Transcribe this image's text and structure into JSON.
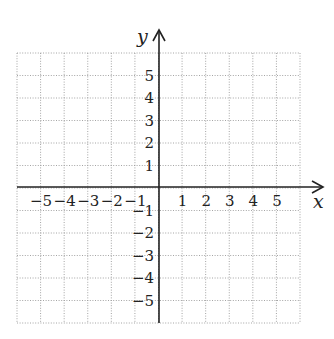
{
  "figure": {
    "type": "coordinate-plane",
    "x_axis_label": "x",
    "y_axis_label": "y",
    "x_range": [
      -6,
      6
    ],
    "y_range": [
      -6,
      6
    ],
    "x_tick_labels": [
      "−5",
      "−4",
      "−3",
      "−2",
      "−1",
      "1",
      "2",
      "3",
      "4",
      "5"
    ],
    "y_tick_labels": [
      "5",
      "4",
      "3",
      "2",
      "1",
      "−1",
      "−2",
      "−3",
      "−4",
      "−5"
    ],
    "grid": "dotted",
    "colors": {
      "axis": "#222222",
      "grid": "#9a9a9a",
      "background": "#ffffff"
    }
  }
}
